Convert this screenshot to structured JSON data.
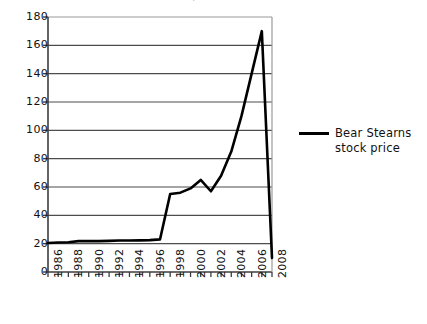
{
  "chart_data": {
    "type": "line",
    "title": "Bear Stearns stock price",
    "xlabel": "",
    "ylabel": "",
    "xlim": [
      1986,
      2008
    ],
    "ylim": [
      0,
      180
    ],
    "ytick_step": 20,
    "xtick_step": 1,
    "xtick_label_step": 2,
    "grid": "horizontal",
    "legend_position": "right",
    "line_color": "#000000",
    "series": [
      {
        "name": "Bear Stearns stock price",
        "x": [
          1986,
          1987,
          1988,
          1989,
          1990,
          1991,
          1992,
          1993,
          1994,
          1995,
          1996,
          1997,
          1998,
          1999,
          2000,
          2001,
          2002,
          2003,
          2004,
          2005,
          2006,
          2007,
          2008
        ],
        "values": [
          20.5,
          20.8,
          21.0,
          21.8,
          21.8,
          21.8,
          22.0,
          22.2,
          22.2,
          22.3,
          22.5,
          23.0,
          55.0,
          56.0,
          59.0,
          65.0,
          57.0,
          68.0,
          85.0,
          110.0,
          140.0,
          170.0,
          10.0
        ]
      }
    ],
    "ytick_labels": [
      "180",
      "160",
      "140",
      "120",
      "100",
      "80",
      "60",
      "40",
      "20",
      "0"
    ],
    "ytick_values": [
      180,
      160,
      140,
      120,
      100,
      80,
      60,
      40,
      20,
      0
    ],
    "xtick_labels": [
      "1986",
      "1988",
      "1990",
      "1992",
      "1994",
      "1996",
      "1998",
      "2000",
      "2002",
      "2004",
      "2006",
      "2008"
    ],
    "xtick_values": [
      1986,
      1988,
      1990,
      1992,
      1994,
      1996,
      1998,
      2000,
      2002,
      2004,
      2006,
      2008
    ]
  },
  "legend": {
    "entries": [
      {
        "label": "Bear Stearns stock price",
        "color": "#000000"
      }
    ]
  },
  "colors": {
    "line": "#000000",
    "grid": "#4d4d4d",
    "axis": "#3d3d3d",
    "background": "#ffffff",
    "text": "#111111"
  }
}
